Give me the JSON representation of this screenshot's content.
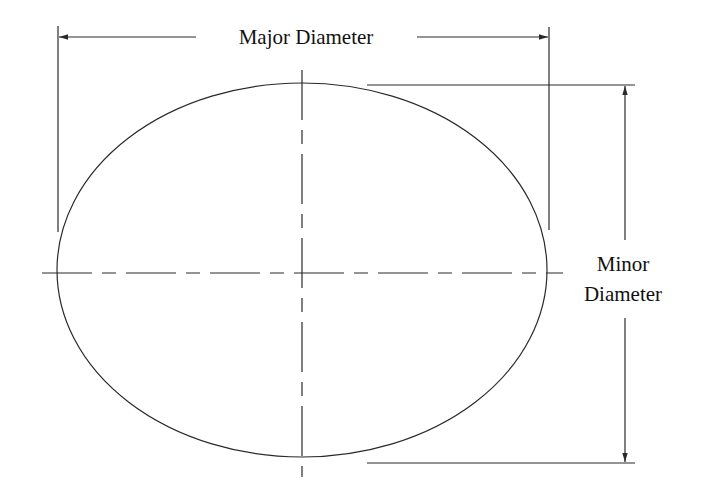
{
  "diagram": {
    "labels": {
      "major": "Major Diameter",
      "minor_line1": "Minor",
      "minor_line2": "Diameter"
    },
    "colors": {
      "stroke": "#2a2a2a",
      "text": "#111111",
      "background": "#ffffff"
    },
    "ellipse": {
      "cx": 302,
      "cy": 270,
      "rx": 245,
      "ry": 187
    }
  }
}
